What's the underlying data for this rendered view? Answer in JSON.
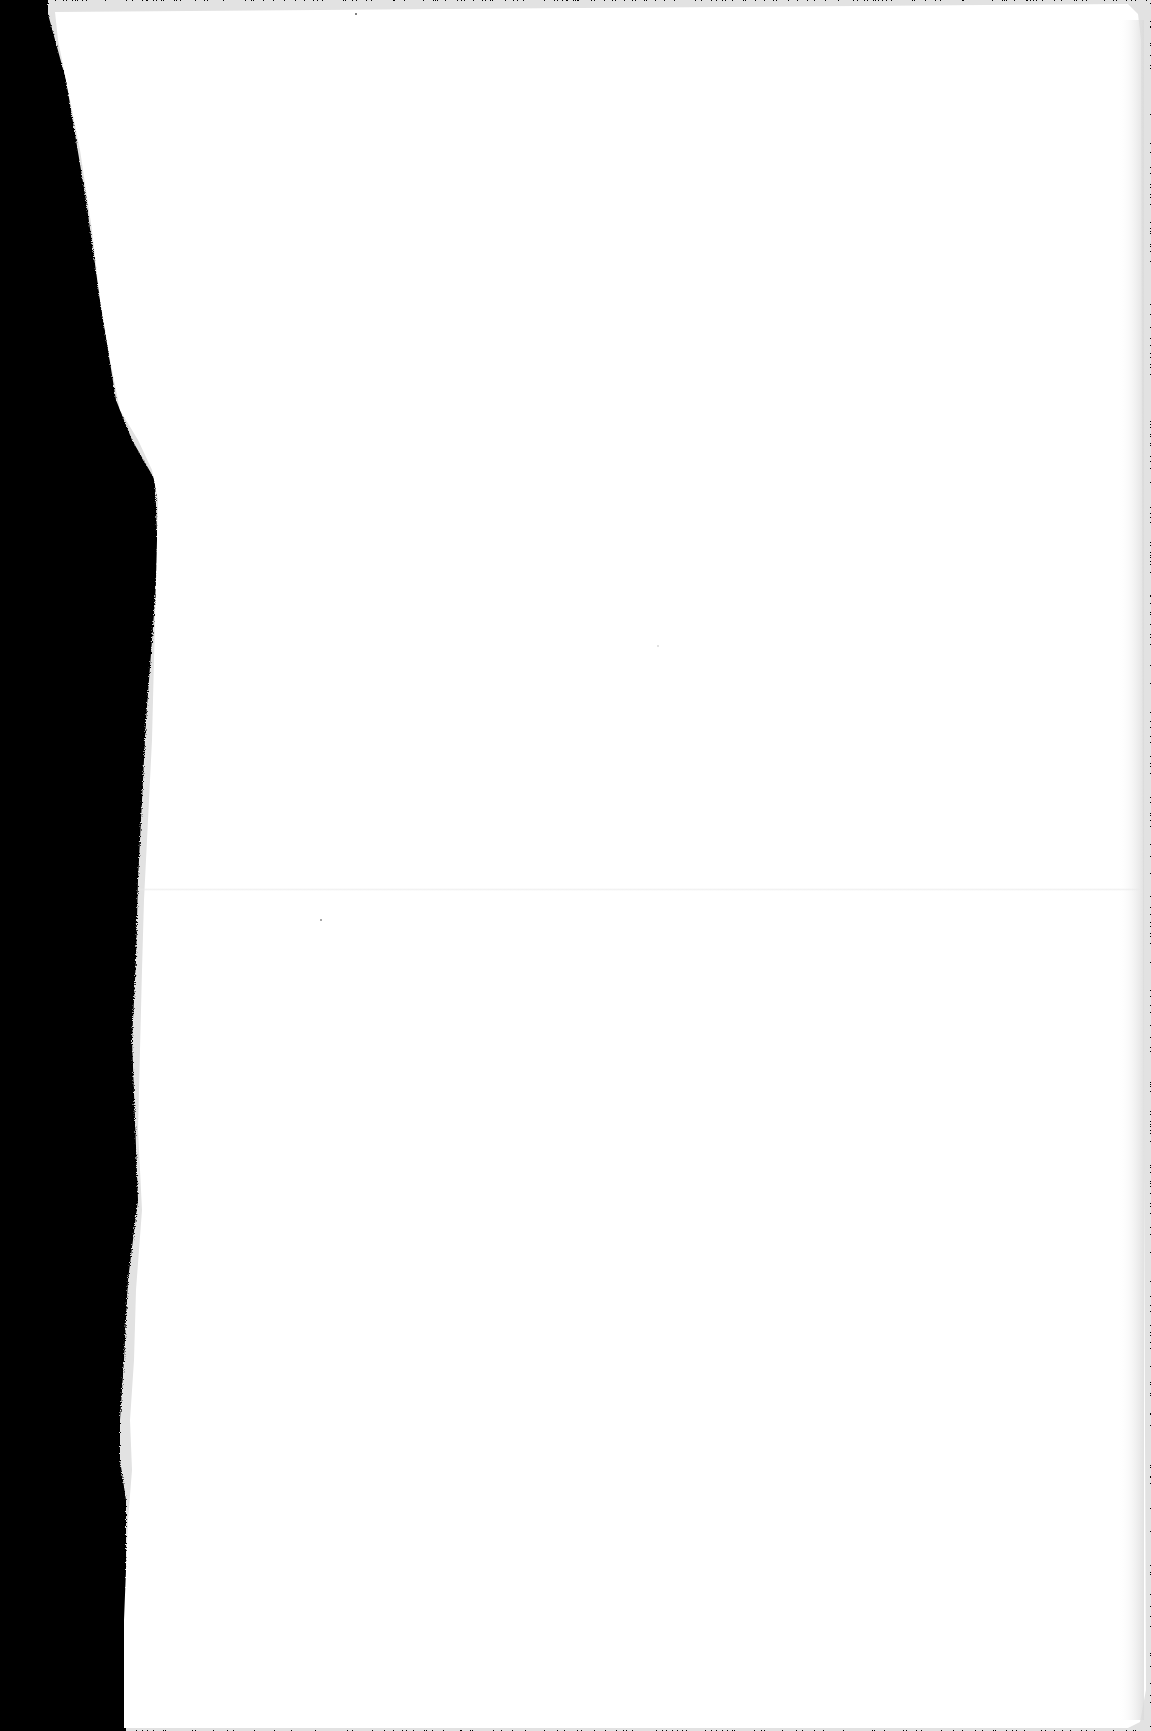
{
  "document": {
    "type": "scanned-blank-page",
    "text_content": [],
    "colors": {
      "background": "#000000",
      "paper": "#ffffff",
      "torn_edge_fibers": "#e6e6e6",
      "fold_line": "#e8e8e8",
      "page_edge_shadow": "#1a1a1a"
    }
  }
}
